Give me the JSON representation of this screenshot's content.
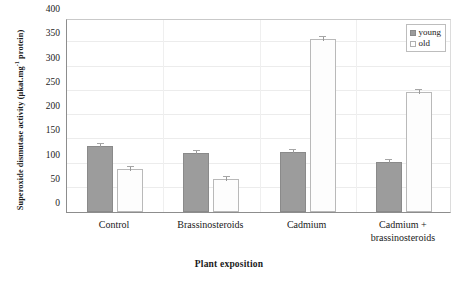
{
  "chart_data": {
    "type": "bar",
    "title": "",
    "subtitle": "",
    "xlabel": "Plant exposition",
    "ylabel": "Superoxide dismutase activity (µkat.mg",
    "ylabel_sup": "-1",
    "ylabel_tail": " protein)",
    "categories": [
      "Control",
      "Brassinosteroids",
      "Cadmium",
      "Cadmium +|brassinosteroids"
    ],
    "series": [
      {
        "name": "young",
        "color": "#9c9c9c",
        "values": [
          136,
          122,
          124,
          103
        ]
      },
      {
        "name": "old",
        "color": "#ffffff",
        "values": [
          88,
          68,
          356,
          248
        ]
      }
    ],
    "ylim": [
      0,
      400
    ],
    "yticks": [
      0,
      50,
      100,
      150,
      200,
      250,
      300,
      350,
      400
    ],
    "ytick_labels": [
      "0",
      "50",
      "100",
      "150",
      "200",
      "250",
      "300",
      "350",
      "400"
    ],
    "grid": true,
    "legend_position": "top-right",
    "error_bars": true
  },
  "legend": {
    "entries": [
      {
        "label": "young",
        "swatch": "filled-gray-square"
      },
      {
        "label": "old",
        "swatch": "empty-white-square"
      }
    ]
  }
}
